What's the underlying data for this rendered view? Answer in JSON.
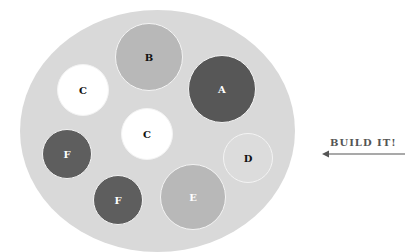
{
  "diagram": {
    "plate_color": "#d9d9d9",
    "circles": [
      {
        "id": "B",
        "label": "B",
        "cx": 149,
        "cy": 57,
        "r": 34,
        "fill": "#b8b8b8",
        "text": "#111111"
      },
      {
        "id": "A",
        "label": "A",
        "cx": 222,
        "cy": 89,
        "r": 34,
        "fill": "#575757",
        "text": "#ffffff"
      },
      {
        "id": "C1",
        "label": "C",
        "cx": 83,
        "cy": 90,
        "r": 26,
        "fill": "#ffffff",
        "text": "#111111"
      },
      {
        "id": "C2",
        "label": "C",
        "cx": 147,
        "cy": 134,
        "r": 26,
        "fill": "#ffffff",
        "text": "#111111"
      },
      {
        "id": "F1",
        "label": "F",
        "cx": 67,
        "cy": 154,
        "r": 25,
        "fill": "#5e5e5e",
        "text": "#ffffff"
      },
      {
        "id": "D",
        "label": "D",
        "cx": 248,
        "cy": 158,
        "r": 25,
        "fill": "#dcdcdc",
        "text": "#111111"
      },
      {
        "id": "F2",
        "label": "F",
        "cx": 118,
        "cy": 200,
        "r": 25,
        "fill": "#5e5e5e",
        "text": "#ffffff"
      },
      {
        "id": "E",
        "label": "E",
        "cx": 193,
        "cy": 197,
        "r": 33,
        "fill": "#b8b8b8",
        "text": "#ffffff"
      }
    ],
    "callout": {
      "text": "BUILD IT!",
      "color": "#555555"
    }
  }
}
